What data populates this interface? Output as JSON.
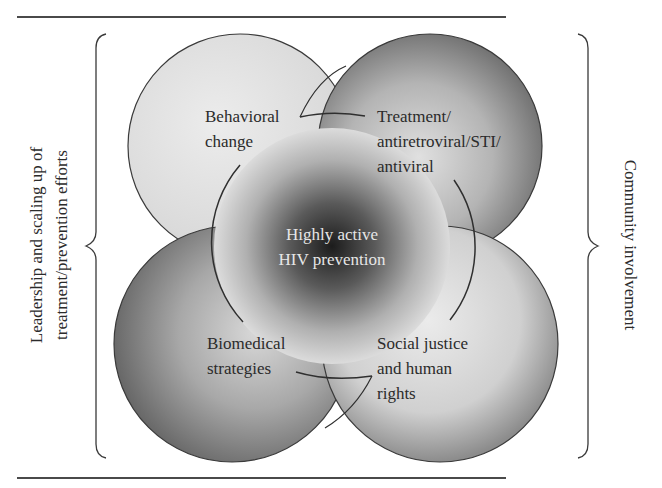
{
  "diagram": {
    "center": {
      "lines": [
        "Highly active",
        "HIV prevention"
      ]
    },
    "quadrants": [
      {
        "id": "behavioral",
        "lines": [
          "Behavioral",
          "change"
        ]
      },
      {
        "id": "treatment",
        "lines": [
          "Treatment/",
          "antiretroviral/STI/",
          "antiviral"
        ]
      },
      {
        "id": "biomedical",
        "lines": [
          "Biomedical",
          "strategies"
        ]
      },
      {
        "id": "social-justice",
        "lines": [
          "Social justice",
          "and human",
          "rights"
        ]
      }
    ],
    "left_brace_label": {
      "lines": [
        "Leadership and scaling up of",
        "treatment/prevention efforts"
      ]
    },
    "right_brace_label": {
      "lines": [
        "Community involvement"
      ]
    }
  },
  "colors": {
    "rule": "#4a4a4a",
    "outline": "#3a3a3a",
    "text": "#2b2b2b",
    "center_text": "#e6e6e6",
    "center_dark": "#1a1a1a"
  }
}
